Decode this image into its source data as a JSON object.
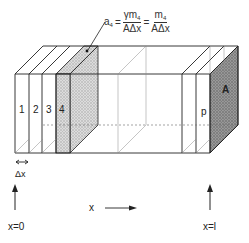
{
  "diagram": {
    "type": "finite-volume slab discretization of a rectangular bar",
    "formula": {
      "lhs": "a",
      "lhs_sub": "4",
      "eq1": "=",
      "frac1_num": "γm",
      "frac1_num_sub": "4",
      "frac1_den": "AΔx",
      "eq2": "=",
      "frac2_num": "m",
      "frac2_num_sub": "4",
      "frac2_den": "AΔx"
    },
    "slice_labels": [
      "1",
      "2",
      "3",
      "4"
    ],
    "end_slice_label": "p",
    "area_label": "A",
    "delta_label": "Δx",
    "axis_label": "x",
    "start_label": "x=0",
    "end_label": "x=l",
    "colors": {
      "line": "#222222",
      "stipple_light": "#cfcfcf",
      "stipple_dark": "#8a8a8a",
      "hatch": "#9a9a9a"
    }
  }
}
